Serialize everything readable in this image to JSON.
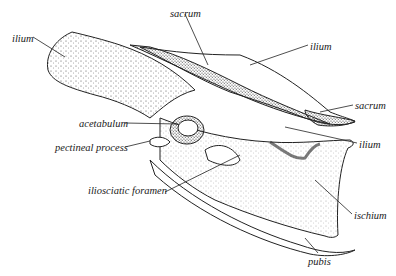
{
  "diagram": {
    "labels": [
      {
        "id": "ilium-left",
        "text": "ilium",
        "x": 12,
        "y": 34
      },
      {
        "id": "sacrum-top",
        "text": "sacrum",
        "x": 170,
        "y": 9
      },
      {
        "id": "ilium-top-right",
        "text": "ilium",
        "x": 310,
        "y": 42
      },
      {
        "id": "sacrum-right",
        "text": "sacrum",
        "x": 355,
        "y": 101
      },
      {
        "id": "acetabulum",
        "text": "acetabulum",
        "x": 79,
        "y": 119
      },
      {
        "id": "pectineal-process",
        "text": "pectineal process",
        "x": 55,
        "y": 143
      },
      {
        "id": "ilium-right",
        "text": "ilium",
        "x": 359,
        "y": 140
      },
      {
        "id": "iliosciatic-foramen",
        "text": "iliosciatic foramen",
        "x": 88,
        "y": 186
      },
      {
        "id": "ischium",
        "text": "ischium",
        "x": 354,
        "y": 211
      },
      {
        "id": "pubis",
        "text": "pubis",
        "x": 308,
        "y": 257
      }
    ]
  }
}
